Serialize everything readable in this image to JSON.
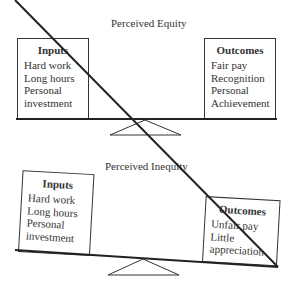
{
  "equity": {
    "title": "Perceived Equity",
    "inputs": {
      "heading": "Inputs",
      "items": [
        "Hard work",
        "Long hours",
        "Personal",
        "investment"
      ]
    },
    "outcomes": {
      "heading": "Outcomes",
      "items": [
        "Fair pay",
        "Recognition",
        "Personal",
        "Achievement"
      ]
    }
  },
  "inequity": {
    "title": "Perceived Inequity",
    "inputs": {
      "heading": "Inputs",
      "items": [
        "Hard work",
        "Long hours",
        "Personal",
        "investment"
      ]
    },
    "outcomes": {
      "heading": "Outcomes",
      "items": [
        "Unfair pay",
        "Little",
        "appreciation"
      ]
    }
  }
}
